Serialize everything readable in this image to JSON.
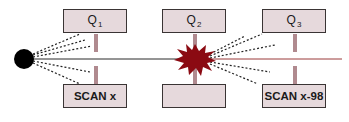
{
  "colors": {
    "box_fill": "#e6d9dc",
    "box_border": "#3a3434",
    "connector": "#b08a8f",
    "beam_line": "#9a3a3a",
    "source_dot": "#000000",
    "explosion": "#8b0a12",
    "dashed_rays": "#222222"
  },
  "top_row": [
    {
      "letter": "Q",
      "sub": "1"
    },
    {
      "letter": "Q",
      "sub": "2"
    },
    {
      "letter": "Q",
      "sub": "3"
    }
  ],
  "bottom_row": [
    {
      "label": "SCAN x"
    },
    {
      "label": ""
    },
    {
      "label": "SCAN x-98"
    }
  ]
}
